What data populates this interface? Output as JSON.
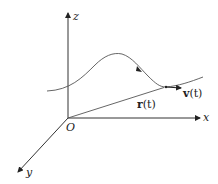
{
  "diagram": {
    "axes": {
      "z": {
        "label": "z"
      },
      "x": {
        "label": "x"
      },
      "y": {
        "label": "y"
      },
      "origin": {
        "label": "O"
      }
    },
    "vectors": {
      "position": {
        "label_main": "r",
        "label_arg": "(t)"
      },
      "velocity": {
        "label_main": "v",
        "label_arg": "(t)"
      }
    },
    "colors": {
      "stroke": "#333333",
      "curve": "#555555",
      "text": "#222222"
    }
  }
}
